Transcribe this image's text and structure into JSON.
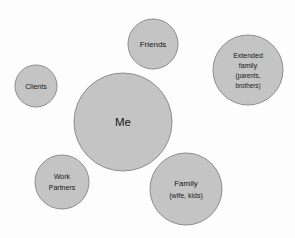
{
  "diagram": {
    "type": "bubble-diagram",
    "background_color": "#fdfdfd",
    "bubble_fill_color": "#c4c4c4",
    "bubble_stroke_color": "#8d8d8d",
    "text_color": "#161616",
    "bubbles": [
      {
        "id": "friends",
        "label": "Friends",
        "lines": [
          "Friends"
        ],
        "cx": 153,
        "cy": 44,
        "r": 25,
        "font_size": 8
      },
      {
        "id": "extended-family",
        "label": "Extended family (parents, brothers)",
        "lines": [
          "Extended",
          "family",
          "(parents,",
          "brothers)"
        ],
        "cx": 248,
        "cy": 70,
        "r": 35,
        "font_size": 7
      },
      {
        "id": "clients",
        "label": "Clients",
        "lines": [
          "Clients"
        ],
        "cx": 36,
        "cy": 86,
        "r": 21,
        "font_size": 7
      },
      {
        "id": "me",
        "label": "Me",
        "lines": [
          "Me"
        ],
        "cx": 123,
        "cy": 122,
        "r": 49,
        "font_size": 11.5
      },
      {
        "id": "work-partners",
        "label": "Work Partners",
        "lines": [
          "Work",
          "Partners"
        ],
        "cx": 62,
        "cy": 182,
        "r": 27,
        "font_size": 7.5
      },
      {
        "id": "family",
        "label": "Family (wife, kids)",
        "lines": [
          "Family",
          "(wife, kids)"
        ],
        "cx": 186,
        "cy": 189,
        "r": 36,
        "font_size": 8.5
      }
    ]
  }
}
